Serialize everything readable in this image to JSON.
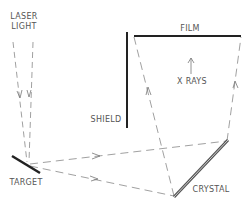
{
  "diagram": {
    "labels": {
      "laser": "LASER",
      "light": "LIGHT",
      "film": "FILM",
      "xrays": "X RAYS",
      "shield": "SHIELD",
      "target": "TARGET",
      "crystal": "CRYSTAL"
    },
    "colors": {
      "solid_line": "#222222",
      "dashed_line": "#888888",
      "crystal": "#555555",
      "text": "#555555"
    }
  }
}
